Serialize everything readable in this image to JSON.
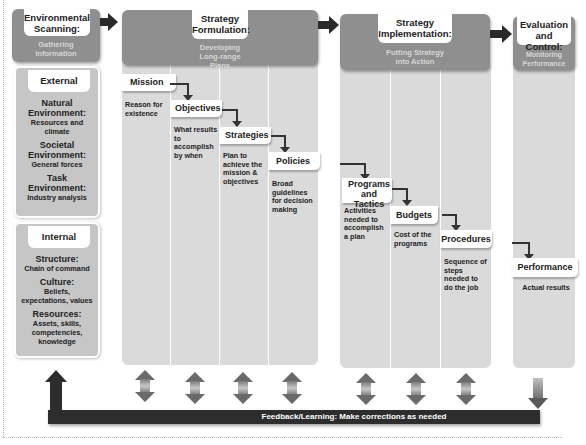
{
  "stages": {
    "scanning": {
      "title": "Environmental Scanning:",
      "subtitle": "Gathering Information"
    },
    "formulation": {
      "title": "Strategy Formulation:",
      "subtitle": "Developing Long-range Plans"
    },
    "implementation": {
      "title": "Strategy Implementation:",
      "subtitle": "Putting Strategy into Action"
    },
    "evaluation": {
      "title": "Evaluation and Control:",
      "subtitle": "Monitoring Performance"
    }
  },
  "external": {
    "title": "External",
    "items": [
      {
        "title": "Natural Environment:",
        "desc": "Resources and climate"
      },
      {
        "title": "Societal Environment:",
        "desc": "General forces"
      },
      {
        "title": "Task Environment:",
        "desc": "Industry analysis"
      }
    ]
  },
  "internal": {
    "title": "Internal",
    "items": [
      {
        "title": "Structure:",
        "desc": "Chain of command"
      },
      {
        "title": "Culture:",
        "desc": "Beliefs, expectations, values"
      },
      {
        "title": "Resources:",
        "desc": "Assets, skills, competencies, knowledge"
      }
    ]
  },
  "steps": [
    {
      "title": "Mission",
      "desc": "Reason for existence"
    },
    {
      "title": "Objectives",
      "desc": "What results to accomplish by when"
    },
    {
      "title": "Strategies",
      "desc": "Plan to achieve the mission & objectives"
    },
    {
      "title": "Policies",
      "desc": "Broad guidelines for decision making"
    },
    {
      "title": "Programs and Tactics",
      "desc": "Activities needed to accomplish a plan"
    },
    {
      "title": "Budgets",
      "desc": "Cost of the programs"
    },
    {
      "title": "Procedures",
      "desc": "Sequence of steps needed to do the job"
    },
    {
      "title": "Performance",
      "desc": "Actual results"
    }
  ],
  "feedback": {
    "label": "Feedback/Learning: Make corrections as needed"
  },
  "colors": {
    "header_gray": "#8f8f8f",
    "column_gray": "#dadada",
    "box_gray": "#c6c6c6",
    "arrow_dark": "#2a2a2a",
    "subtitle_text": "#d6d6d6"
  }
}
